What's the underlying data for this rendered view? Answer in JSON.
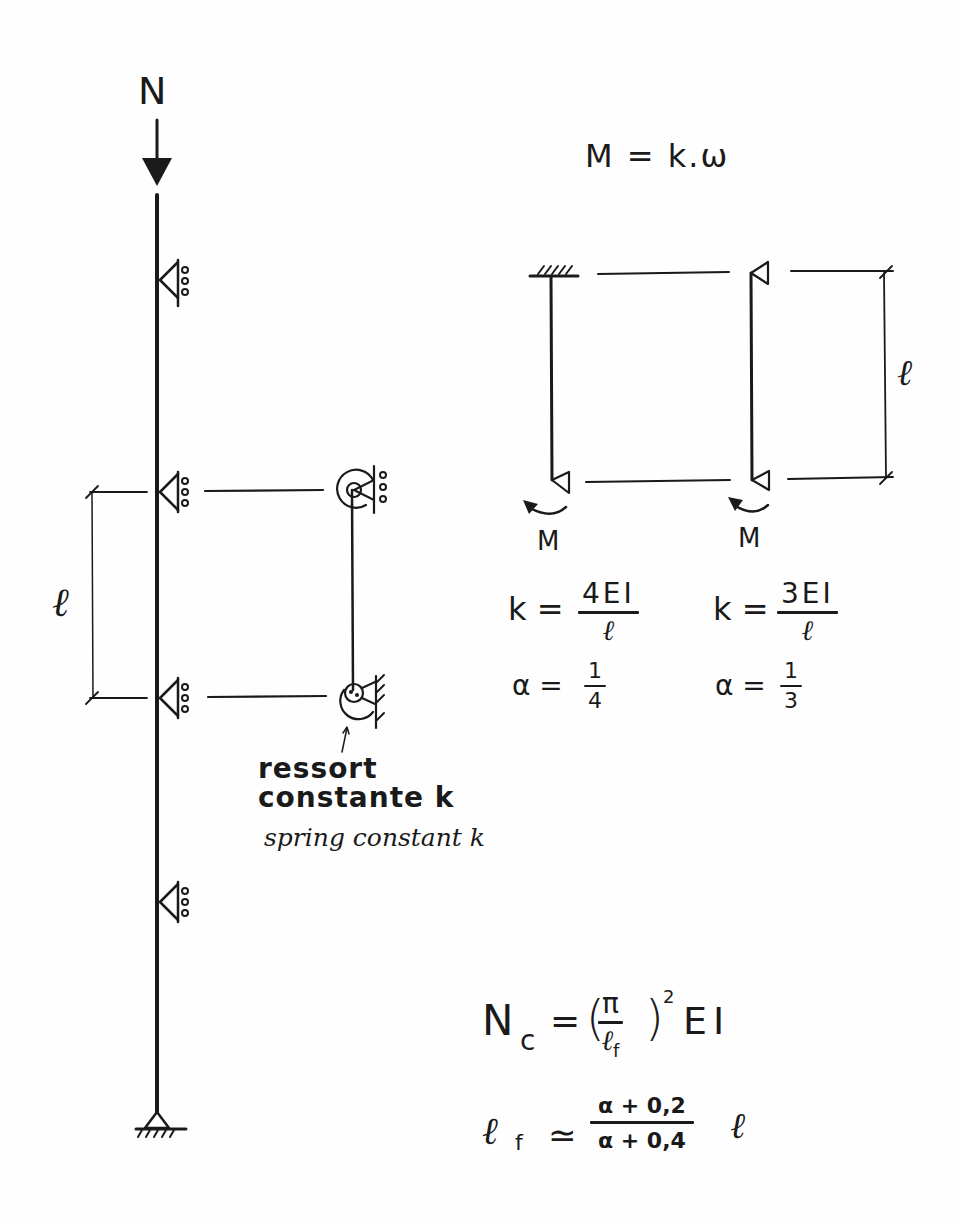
{
  "diagram": {
    "load_label": "N",
    "left_span_label": "ℓ",
    "spring_label_fr_line1": "ressort",
    "spring_label_fr_line2": "constante k",
    "spring_label_en": "spring constant k",
    "moment_relation": "M = k.ω",
    "right_span_label": "ℓ",
    "moment_label_1": "M",
    "moment_label_2": "M"
  },
  "case_fixed": {
    "k_lhs": "k =",
    "k_num": "4EI",
    "k_den": "ℓ",
    "alpha_lhs": "α =",
    "alpha_num": "1",
    "alpha_den": "4"
  },
  "case_pinned": {
    "k_lhs": "k =",
    "k_num": "3EI",
    "k_den": "ℓ",
    "alpha_lhs": "α =",
    "alpha_num": "1",
    "alpha_den": "3"
  },
  "formulas": {
    "nc_lhs": "N",
    "nc_sub": "c",
    "nc_eq": "=",
    "nc_paren_open": "(",
    "nc_num": "π",
    "nc_den": "ℓ",
    "nc_den_sub": "f",
    "nc_paren_close": ")",
    "nc_exp": "2",
    "nc_rhs": "EI",
    "lf_lhs": "ℓ",
    "lf_sub": "f",
    "lf_eq": "≃",
    "lf_num": "α + 0,2",
    "lf_den": "α + 0,4",
    "lf_rhs": "ℓ"
  }
}
